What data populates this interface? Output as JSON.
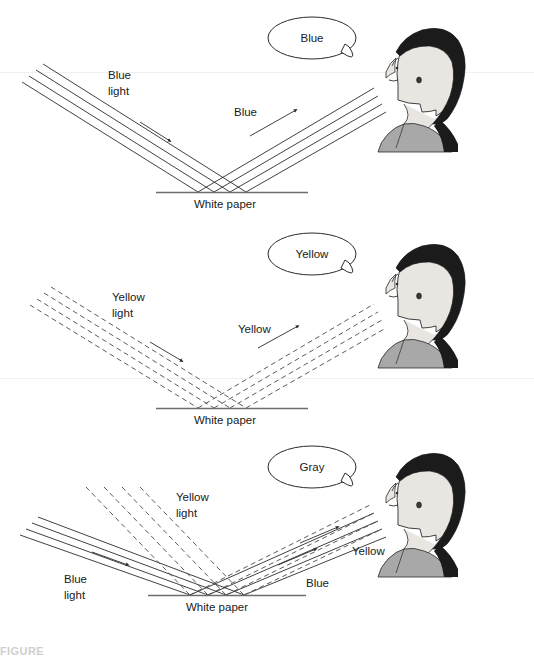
{
  "figure": {
    "caption_partial": "FIGURE",
    "panel_count": 3
  },
  "colors": {
    "ray_stroke": "#2b2b2b",
    "surface_stroke": "#6d6d6d",
    "hair": "#1b1b1b",
    "skin": "#e9e5e0",
    "garment": "#a8a8a8",
    "outline": "#2b2b2b",
    "bubble_fill": "#ffffff",
    "text": "#1a1a1a"
  },
  "panels": [
    {
      "id": "panel-blue",
      "index": 1,
      "speech": "Blue",
      "surface_label": "White paper",
      "incident": {
        "label_line1": "Blue",
        "label_line2": "light",
        "style": "solid",
        "color_name": "blue"
      },
      "reflected": {
        "label": "Blue",
        "style": "solid",
        "color_name": "blue"
      },
      "beams": [
        {
          "name": "incident-blue",
          "style": "solid",
          "ray_count": 4
        },
        {
          "name": "reflected-blue",
          "style": "solid",
          "ray_count": 4
        }
      ]
    },
    {
      "id": "panel-yellow",
      "index": 2,
      "speech": "Yellow",
      "surface_label": "White paper",
      "incident": {
        "label_line1": "Yellow",
        "label_line2": "light",
        "style": "dashed",
        "color_name": "yellow"
      },
      "reflected": {
        "label": "Yellow",
        "style": "dashed",
        "color_name": "yellow"
      },
      "beams": [
        {
          "name": "incident-yellow",
          "style": "dashed",
          "ray_count": 4
        },
        {
          "name": "reflected-yellow",
          "style": "dashed",
          "ray_count": 4
        }
      ]
    },
    {
      "id": "panel-gray",
      "index": 3,
      "speech": "Gray",
      "surface_label": "White paper",
      "incident_a": {
        "label_line1": "Blue",
        "label_line2": "light",
        "style": "solid",
        "color_name": "blue"
      },
      "incident_b": {
        "label_line1": "Yellow",
        "label_line2": "light",
        "style": "dashed",
        "color_name": "yellow"
      },
      "reflected_a": {
        "label": "Blue",
        "style": "solid",
        "color_name": "blue"
      },
      "reflected_b": {
        "label": "Yellow",
        "style": "dashed",
        "color_name": "yellow"
      },
      "beams": [
        {
          "name": "incident-blue",
          "style": "solid",
          "ray_count": 4
        },
        {
          "name": "incident-yellow",
          "style": "dashed",
          "ray_count": 4
        },
        {
          "name": "reflected-blue",
          "style": "solid",
          "ray_count": 4
        },
        {
          "name": "reflected-yellow",
          "style": "dashed",
          "ray_count": 4
        }
      ]
    }
  ]
}
